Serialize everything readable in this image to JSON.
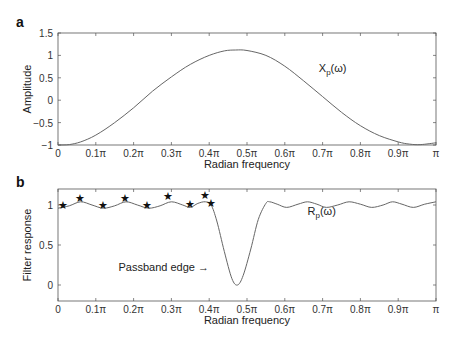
{
  "chart_data": [
    {
      "panel": "a",
      "type": "line",
      "xlabel": "Radian frequency",
      "ylabel": "Amplitude",
      "xlim": [
        0,
        1
      ],
      "ylim": [
        -1,
        1.5
      ],
      "x_unit": "pi",
      "xticks": [
        "0",
        "0.1π",
        "0.2π",
        "0.3π",
        "0.4π",
        "0.5π",
        "0.6π",
        "0.7π",
        "0.8π",
        "0.9π",
        "π"
      ],
      "yticks": [
        "−1",
        "−0.5",
        "0",
        "0.5",
        "1",
        "1.5"
      ],
      "ytick_values": [
        -1,
        -0.5,
        0,
        0.5,
        1,
        1.5
      ],
      "grid": false,
      "series": [
        {
          "name": "Xp(ω)",
          "x": [
            0,
            0.03,
            0.06,
            0.1,
            0.15,
            0.2,
            0.25,
            0.3,
            0.35,
            0.4,
            0.44,
            0.47,
            0.5,
            0.55,
            0.6,
            0.65,
            0.7,
            0.75,
            0.8,
            0.85,
            0.9,
            0.93,
            0.96,
            1.0
          ],
          "y": [
            -1.0,
            -0.99,
            -0.93,
            -0.78,
            -0.5,
            -0.17,
            0.2,
            0.52,
            0.8,
            1.0,
            1.1,
            1.12,
            1.11,
            1.0,
            0.76,
            0.43,
            0.08,
            -0.27,
            -0.57,
            -0.79,
            -0.93,
            -0.98,
            -0.99,
            -0.95
          ]
        }
      ],
      "annotations": [
        {
          "text": "X",
          "sub": "p",
          "suffix": "(ω)",
          "x": 0.69,
          "y": 0.62
        }
      ]
    },
    {
      "panel": "b",
      "type": "line",
      "xlabel": "Radian frequency",
      "ylabel": "Filter response",
      "xlim": [
        0,
        1
      ],
      "ylim": [
        -0.2,
        1.2
      ],
      "x_unit": "pi",
      "xticks": [
        "0",
        "0.1π",
        "0.2π",
        "0.3π",
        "0.4π",
        "0.5π",
        "0.6π",
        "0.7π",
        "0.8π",
        "0.9π",
        "π"
      ],
      "yticks": [
        "0",
        "0.5",
        "1"
      ],
      "ytick_values": [
        0,
        0.5,
        1
      ],
      "grid": false,
      "series": [
        {
          "name": "Rp(ω)",
          "x": [
            0,
            0.03,
            0.06,
            0.09,
            0.12,
            0.15,
            0.18,
            0.21,
            0.24,
            0.27,
            0.3,
            0.33,
            0.35,
            0.37,
            0.39,
            0.405,
            0.42,
            0.44,
            0.46,
            0.475,
            0.49,
            0.51,
            0.53,
            0.55,
            0.56,
            0.58,
            0.605,
            0.635,
            0.66,
            0.685,
            0.71,
            0.74,
            0.77,
            0.8,
            0.83,
            0.86,
            0.885,
            0.91,
            0.94,
            0.97,
            1.0
          ],
          "y": [
            0.96,
            0.99,
            1.04,
            1.0,
            0.96,
            0.99,
            1.04,
            1.0,
            0.96,
            0.99,
            1.04,
            1.0,
            0.97,
            1.02,
            1.04,
            1.0,
            0.8,
            0.42,
            0.08,
            0.0,
            0.12,
            0.45,
            0.82,
            1.02,
            1.04,
            1.01,
            0.97,
            1.01,
            1.04,
            1.01,
            0.97,
            1.0,
            1.04,
            1.01,
            0.97,
            1.0,
            1.04,
            1.01,
            0.97,
            1.01,
            1.04
          ]
        }
      ],
      "markers": {
        "symbol": "★",
        "points": [
          {
            "x": 0.014,
            "y": 1.0
          },
          {
            "x": 0.058,
            "y": 1.09
          },
          {
            "x": 0.119,
            "y": 1.0
          },
          {
            "x": 0.178,
            "y": 1.09
          },
          {
            "x": 0.235,
            "y": 1.0
          },
          {
            "x": 0.29,
            "y": 1.11
          },
          {
            "x": 0.349,
            "y": 1.01
          },
          {
            "x": 0.389,
            "y": 1.12
          },
          {
            "x": 0.405,
            "y": 1.03
          }
        ]
      },
      "annotations": [
        {
          "text": "R",
          "sub": "p",
          "suffix": "(ω)",
          "x": 0.66,
          "y": 0.87
        },
        {
          "text": "Passband edge →",
          "x": 0.16,
          "y": 0.18
        }
      ]
    }
  ],
  "panels": {
    "a": {
      "letter": "a",
      "ylabel": "Amplitude",
      "xlabel": "Radian frequency"
    },
    "b": {
      "letter": "b",
      "ylabel": "Filter response",
      "xlabel": "Radian frequency"
    }
  }
}
